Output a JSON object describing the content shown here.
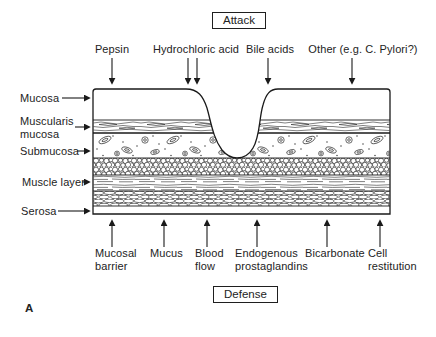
{
  "panel_label": "A",
  "attack": {
    "box_label": "Attack",
    "factors": [
      "Pepsin",
      "Hydrochloric acid",
      "Bile acids",
      "Other (e.g. C. Pylori?)"
    ]
  },
  "defense": {
    "box_label": "Defense",
    "factors": [
      "Mucosal barrier",
      "Mucus",
      "Blood flow",
      "Endogenous prostaglandins",
      "Bicarbonate",
      "Cell restitution"
    ]
  },
  "layers": [
    "Mucosa",
    "Muscularis mucosa",
    "Submucosa",
    "Muscle layer",
    "Serosa"
  ],
  "colors": {
    "ink": "#1a1a1a",
    "background": "#ffffff"
  }
}
